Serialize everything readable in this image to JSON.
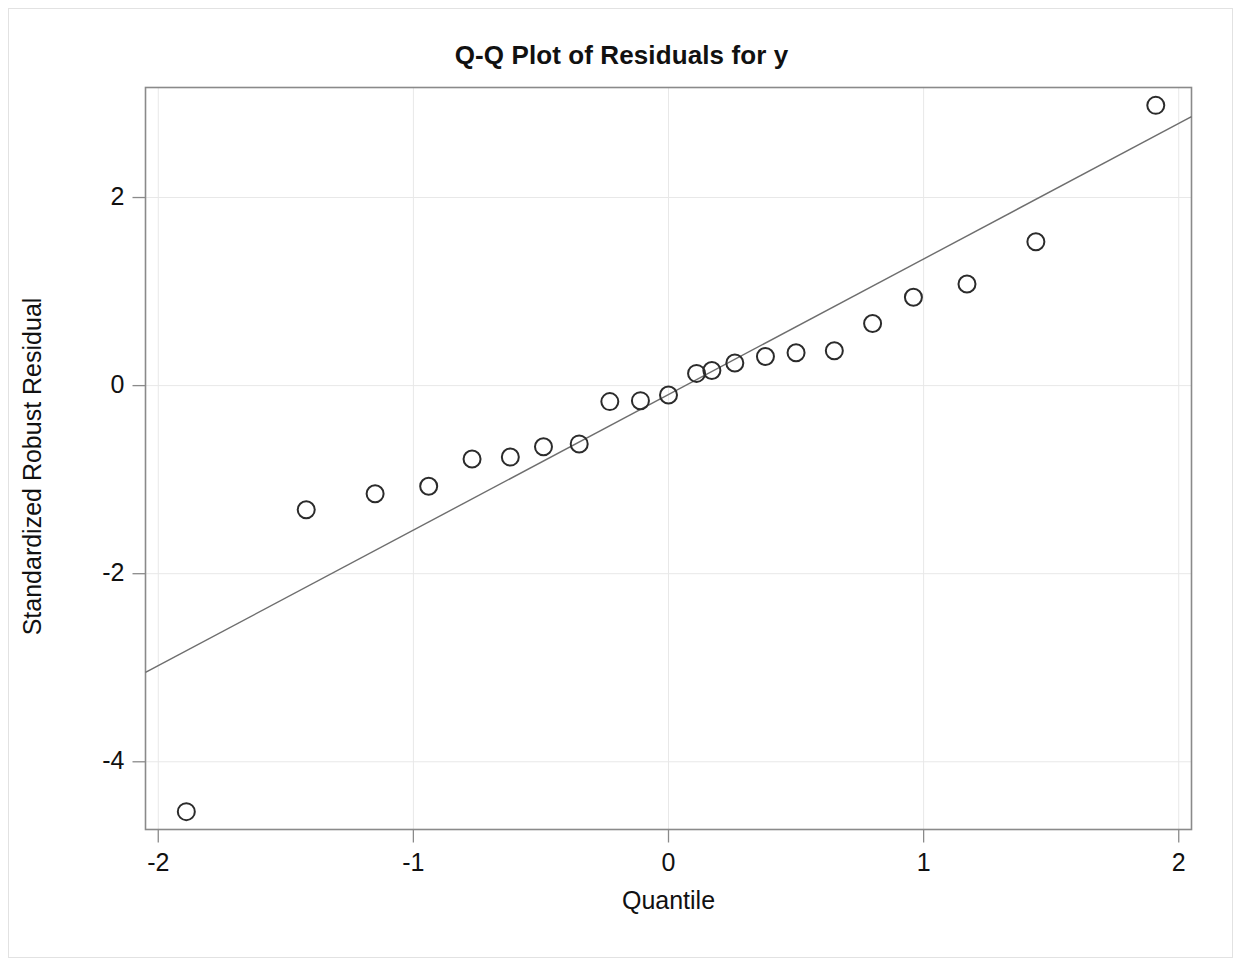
{
  "chart_data": {
    "type": "scatter",
    "title": "Q-Q Plot of Residuals for y",
    "xlabel": "Quantile",
    "ylabel": "Standardized Robust Residual",
    "xlim": [
      -2.05,
      2.05
    ],
    "ylim": [
      -4.72,
      3.17
    ],
    "xticks": [
      -2,
      -1,
      0,
      1,
      2
    ],
    "xtick_labels": [
      "-2",
      "-1",
      "0",
      "1",
      "2"
    ],
    "yticks": [
      2,
      0,
      -2,
      -4
    ],
    "ytick_labels": [
      "2",
      "0",
      "-2",
      "-4"
    ],
    "grid": true,
    "grid_color": "#e8e8e8",
    "legend": null,
    "marker": {
      "shape": "circle-open",
      "edge_color": "#2b2b2b",
      "fill_color": "none",
      "radius": 8.5,
      "stroke_width": 2
    },
    "reference_line": {
      "label": "normal reference line",
      "color": "#6e6e6e",
      "width": 1.4,
      "x": [
        -2.05,
        2.05
      ],
      "y": [
        -3.05,
        2.86
      ],
      "slope": 1.442,
      "intercept": -0.095
    },
    "n_points": 23,
    "x": [
      -1.89,
      -1.42,
      -1.15,
      -0.94,
      -0.77,
      -0.62,
      -0.49,
      -0.35,
      -0.23,
      -0.11,
      0.0,
      0.11,
      0.17,
      0.26,
      0.38,
      0.5,
      0.65,
      0.8,
      0.96,
      1.17,
      1.44,
      1.91
    ],
    "y": [
      -4.53,
      -1.32,
      -1.15,
      -1.07,
      -0.78,
      -0.76,
      -0.65,
      -0.62,
      -0.17,
      -0.16,
      -0.1,
      0.13,
      0.16,
      0.24,
      0.31,
      0.35,
      0.37,
      0.66,
      0.94,
      1.08,
      1.53,
      2.98
    ],
    "points": [
      {
        "x": -1.89,
        "y": -4.53
      },
      {
        "x": -1.42,
        "y": -1.32
      },
      {
        "x": -1.15,
        "y": -1.15
      },
      {
        "x": -0.94,
        "y": -1.07
      },
      {
        "x": -0.77,
        "y": -0.78
      },
      {
        "x": -0.62,
        "y": -0.76
      },
      {
        "x": -0.49,
        "y": -0.65
      },
      {
        "x": -0.35,
        "y": -0.62
      },
      {
        "x": -0.23,
        "y": -0.17
      },
      {
        "x": -0.11,
        "y": -0.16
      },
      {
        "x": 0.0,
        "y": -0.1
      },
      {
        "x": 0.11,
        "y": 0.13
      },
      {
        "x": 0.17,
        "y": 0.16
      },
      {
        "x": 0.26,
        "y": 0.24
      },
      {
        "x": 0.38,
        "y": 0.31
      },
      {
        "x": 0.5,
        "y": 0.35
      },
      {
        "x": 0.65,
        "y": 0.37
      },
      {
        "x": 0.8,
        "y": 0.66
      },
      {
        "x": 0.96,
        "y": 0.94
      },
      {
        "x": 1.17,
        "y": 1.08
      },
      {
        "x": 1.44,
        "y": 1.53
      },
      {
        "x": 1.91,
        "y": 2.98
      }
    ]
  },
  "figure": {
    "background_color": "#ffffff",
    "frame_color": "#808080",
    "border_color": "#e2e2e2"
  }
}
